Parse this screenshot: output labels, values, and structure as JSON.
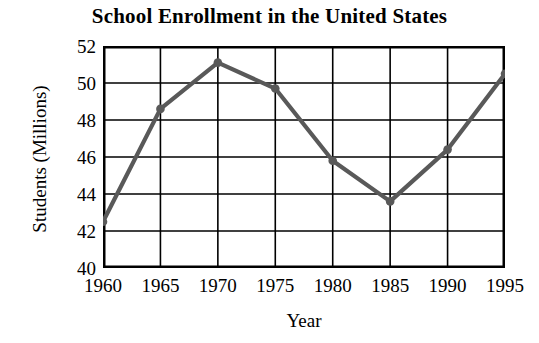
{
  "chart_data": {
    "type": "line",
    "title": "School Enrollment in the United States",
    "xlabel": "Year",
    "ylabel": "Students (Millions)",
    "x": [
      1960,
      1965,
      1970,
      1975,
      1980,
      1985,
      1990,
      1995
    ],
    "values": [
      42.5,
      48.6,
      51.1,
      49.7,
      45.8,
      43.6,
      46.4,
      50.5
    ],
    "xtick_labels": [
      "1960",
      "1965",
      "1970",
      "1975",
      "1980",
      "1985",
      "1990",
      "1995"
    ],
    "ytick_labels": [
      "52",
      "50",
      "48",
      "46",
      "44",
      "42",
      "40"
    ],
    "ytick_values": [
      52,
      50,
      48,
      46,
      44,
      42,
      40
    ],
    "xlim": [
      1960,
      1995
    ],
    "ylim": [
      40,
      52
    ],
    "grid": true,
    "legend": false,
    "series_color": "#595959",
    "axis_color": "#000000",
    "background": "#ffffff",
    "marker": "circle"
  }
}
